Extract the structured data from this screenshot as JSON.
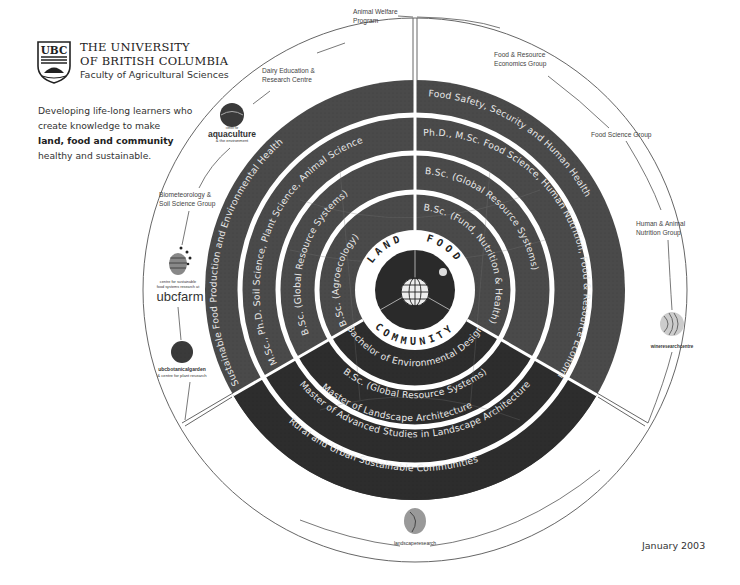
{
  "header": {
    "logo_text": "UBC",
    "university_line1": "THE UNIVERSITY",
    "university_line2": "OF BRITISH COLUMBIA",
    "faculty": "Faculty of Agricultural Sciences"
  },
  "tagline": {
    "line1": "Developing life-long learners who",
    "line2": "create knowledge to make",
    "line3": "land, food and community",
    "line4": "healthy and sustainable."
  },
  "date": "January 2003",
  "core": {
    "land": "LAND",
    "food": "FOOD",
    "community": "COMMUNITY"
  },
  "rings": {
    "food": {
      "outer": "Food Safety, Security and Human Health",
      "phd": "Ph.D., M.Sc. Food Science, Human Nutrition, Food & Resource Economics",
      "grs": "B.Sc. (Global Resource Systems)",
      "fnh": "B.Sc. (Fund, Nutrition & Health)"
    },
    "land": {
      "outer": "Sustainable Food Production and Environmental Health",
      "phd": "M.Sc., Ph.D. Soil Science, Plant Science, Animal Science",
      "grs": "B.Sc. (Global Resource Systems)",
      "agro": "B.Sc. (Agroecology)"
    },
    "community": {
      "outer": "Rural and Urban Sustainable Communities",
      "mla1": "Master of Landscape Architecture",
      "mla2": "Master of Advanced Studies in Landscape Architecture",
      "grs": "B.Sc. (Global Resource Systems)",
      "bed": "Bachelor of Environmental Design"
    }
  },
  "outer_labels": {
    "animal_welfare_1": "Animal Welfare",
    "animal_welfare_2": "Program",
    "dairy_1": "Dairy Education &",
    "dairy_2": "Research Centre",
    "food_resource_1": "Food & Resource",
    "food_resource_2": "Economics Group",
    "food_science": "Food Science Group",
    "human_animal_1": "Human & Animal",
    "human_animal_2": "Nutrition Group",
    "biomet_1": "Biometeorology &",
    "biomet_2": "Soil Science Group"
  },
  "partner_logos": {
    "aquaculture_top": "centre for",
    "aquaculture": "aquaculture",
    "aquaculture_sub": "& the environment",
    "ubcfarm_sub1": "centre for sustainable",
    "ubcfarm_sub2": "food systems research at",
    "ubcfarm": "ubcfarm",
    "botanical_1": "ubcbotanicalgarden",
    "botanical_2": "& centre for plant research",
    "wine": "wineresearchcentre",
    "landscape": "landscaperesearch"
  },
  "colors": {
    "ring_grey": "#4a4a4a",
    "ring_dark": "#2b2b2b",
    "background": "#ffffff",
    "line": "#555555"
  }
}
